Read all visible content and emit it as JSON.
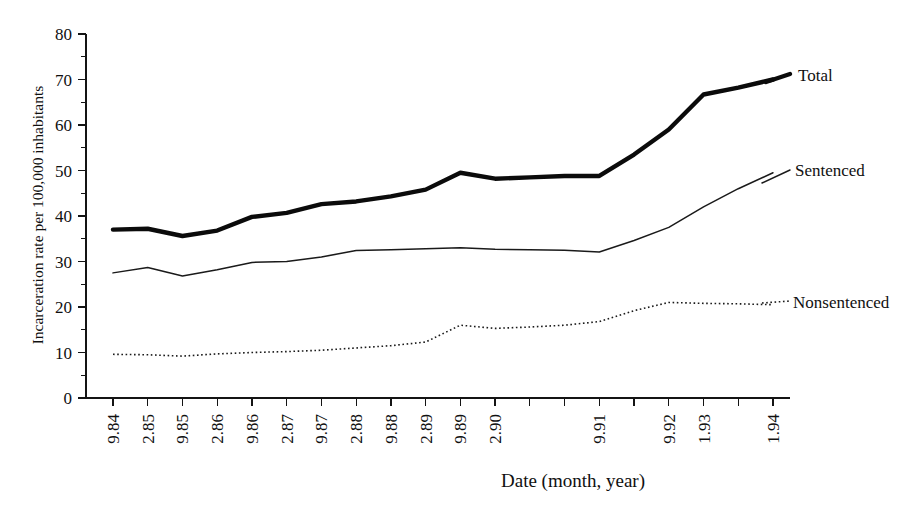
{
  "chart_data": {
    "type": "line",
    "title": "",
    "subtitle": "",
    "xlabel": "Date (month, year)",
    "ylabel": "Incarceration rate per 100,000 inhabitants",
    "x": [
      "9.84",
      "2.85",
      "9.85",
      "2.86",
      "9.86",
      "2.87",
      "9.87",
      "2.88",
      "9.88",
      "2.89",
      "9.89",
      "2.90",
      "9.90",
      "2.91",
      "9.91",
      "2.92",
      "9.92",
      "1.93",
      "9.93",
      "1.94"
    ],
    "categories": [
      "9.84",
      "2.85",
      "9.85",
      "2.86",
      "9.86",
      "2.87",
      "9.87",
      "2.88",
      "9.88",
      "2.89",
      "9.89",
      "2.90",
      "9.90",
      "2.91",
      "9.91",
      "2.92",
      "9.92",
      "1.93",
      "9.93",
      "1.94"
    ],
    "xtick_labels": [
      "9.84",
      "2.85",
      "9.85",
      "2.86",
      "9.86",
      "2.87",
      "9.87",
      "2.88",
      "9.88",
      "2.89",
      "9.89",
      "2.90",
      "",
      "",
      "9.91",
      "",
      "9.92",
      "1.93",
      "",
      "1.94"
    ],
    "ytick_labels": [
      "0",
      "10",
      "20",
      "30",
      "40",
      "50",
      "60",
      "70",
      "80"
    ],
    "ytick_values": [
      0,
      10,
      20,
      30,
      40,
      50,
      60,
      70,
      80
    ],
    "yminor_values": [
      5,
      15,
      25,
      35,
      45,
      55,
      65,
      75
    ],
    "ylim": [
      0,
      80
    ],
    "grid": false,
    "legend_position": "right-inline",
    "series": [
      {
        "name": "Total",
        "style": "thick-solid",
        "color": "#0b0b0b",
        "values": [
          37.0,
          37.2,
          35.6,
          36.8,
          39.8,
          40.7,
          42.6,
          43.2,
          44.3,
          45.8,
          49.5,
          48.2,
          48.5,
          48.8,
          48.8,
          53.5,
          59.0,
          66.7,
          68.2,
          70.0
        ]
      },
      {
        "name": "Sentenced",
        "style": "thin-solid",
        "color": "#1a1a1a",
        "values": [
          27.5,
          28.7,
          26.8,
          28.2,
          29.8,
          30.0,
          31.0,
          32.4,
          32.6,
          32.8,
          33.0,
          32.7,
          32.6,
          32.5,
          32.1,
          34.6,
          37.5,
          42.0,
          46.0,
          49.5
        ]
      },
      {
        "name": "Nonsentenced",
        "style": "dotted",
        "color": "#1a1a1a",
        "values": [
          9.6,
          9.5,
          9.2,
          9.7,
          10.0,
          10.2,
          10.5,
          11.0,
          11.5,
          12.3,
          16.0,
          15.3,
          15.6,
          16.0,
          16.8,
          19.2,
          21.0,
          20.8,
          20.7,
          20.5
        ]
      }
    ]
  },
  "axes": {
    "x_title": "Date (month, year)",
    "y_title": "Incarceration rate per 100,000 inhabitants"
  },
  "legend": {
    "total_label": "Total",
    "sentenced_label": "Sentenced",
    "nonsentenced_label": "Nonsentenced"
  }
}
